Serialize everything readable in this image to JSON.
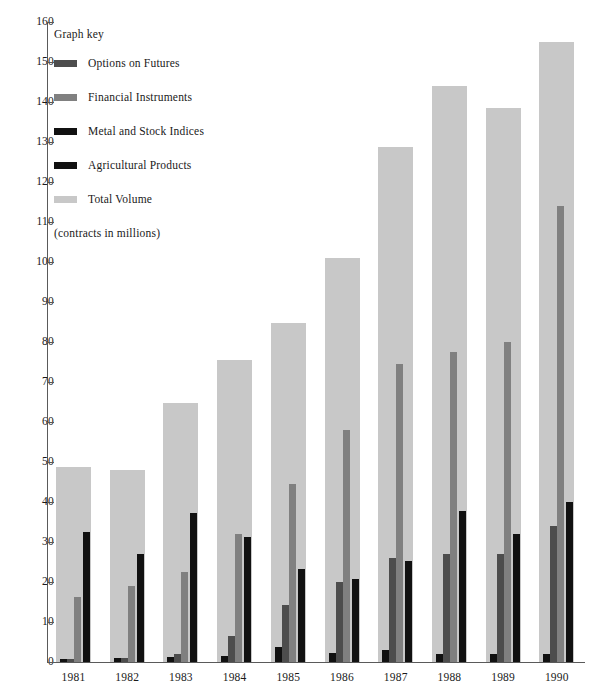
{
  "chart_data": {
    "type": "bar",
    "title": "",
    "xlabel": "",
    "ylabel": "",
    "units_note": "(contracts in millions)",
    "legend_title": "Graph key",
    "legend_position": "inside-top-left",
    "grid": false,
    "ylim": [
      0,
      160
    ],
    "ytick_step": 10,
    "categories": [
      "1981",
      "1982",
      "1983",
      "1984",
      "1985",
      "1986",
      "1987",
      "1988",
      "1989",
      "1990"
    ],
    "ytick_labels": [
      "0",
      "10",
      "20",
      "30",
      "40",
      "50",
      "60",
      "70",
      "80",
      "90",
      "100",
      "110",
      "120",
      "130",
      "140",
      "150",
      "160"
    ],
    "series": [
      {
        "name": "Options on Futures",
        "color": "#4d4d4d",
        "values": [
          0.8,
          1.0,
          2.0,
          6.5,
          14.3,
          20.0,
          26.0,
          27.0,
          27.0,
          34.0
        ]
      },
      {
        "name": "Financial Instruments",
        "color": "#808080",
        "values": [
          16.2,
          19.0,
          22.5,
          32.0,
          44.5,
          58.0,
          74.5,
          77.5,
          80.0,
          114.0
        ]
      },
      {
        "name": "Metal and Stock Indices",
        "color": "#111111",
        "values": [
          32.5,
          27.0,
          37.3,
          31.2,
          23.2,
          20.8,
          25.3,
          37.8,
          32.0,
          40.0
        ]
      },
      {
        "name": "Agricultural Products",
        "color": "#111111",
        "values": [
          0.7,
          1.0,
          1.2,
          1.5,
          3.8,
          2.2,
          3.0,
          2.0,
          2.0,
          2.0
        ]
      },
      {
        "name": "Total Volume",
        "color": "#c8c8c8",
        "values": [
          48.8,
          48.0,
          64.7,
          75.5,
          84.8,
          101.0,
          128.8,
          144.0,
          138.5,
          155.0
        ]
      }
    ]
  }
}
